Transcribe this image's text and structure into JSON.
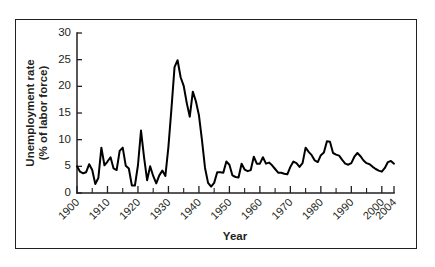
{
  "chart_data": {
    "type": "line",
    "title": "",
    "xlabel": "Year",
    "ylabel_line1": "Unemployment rate",
    "ylabel_line2": "(% of labor force)",
    "ylim": [
      0,
      30
    ],
    "xlim": [
      1900,
      2004
    ],
    "yticks": [
      0,
      5,
      10,
      15,
      20,
      25,
      30
    ],
    "ytick_labels": [
      "0",
      "5",
      "10",
      "15",
      "20",
      "25",
      "30"
    ],
    "xticks": [
      1900,
      1910,
      1920,
      1930,
      1940,
      1950,
      1960,
      1970,
      1980,
      1990,
      2000,
      2004
    ],
    "xtick_labels": [
      "1900",
      "1910",
      "1920",
      "1930",
      "1940",
      "1950",
      "1960",
      "1970",
      "1980",
      "1990",
      "2000",
      "2004"
    ],
    "xminor_tick_interval": 5,
    "grid": false,
    "legend": "none",
    "line_color": "#000000",
    "frame_color": "#231f20",
    "series": [
      {
        "name": "Unemployment rate (% of labor force)",
        "x": [
          1900,
          1901,
          1902,
          1903,
          1904,
          1905,
          1906,
          1907,
          1908,
          1909,
          1910,
          1911,
          1912,
          1913,
          1914,
          1915,
          1916,
          1917,
          1918,
          1919,
          1920,
          1921,
          1922,
          1923,
          1924,
          1925,
          1926,
          1927,
          1928,
          1929,
          1930,
          1931,
          1932,
          1933,
          1934,
          1935,
          1936,
          1937,
          1938,
          1939,
          1940,
          1941,
          1942,
          1943,
          1944,
          1945,
          1946,
          1947,
          1948,
          1949,
          1950,
          1951,
          1952,
          1953,
          1954,
          1955,
          1956,
          1957,
          1958,
          1959,
          1960,
          1961,
          1962,
          1963,
          1964,
          1965,
          1966,
          1967,
          1968,
          1969,
          1970,
          1971,
          1972,
          1973,
          1974,
          1975,
          1976,
          1977,
          1978,
          1979,
          1980,
          1981,
          1982,
          1983,
          1984,
          1985,
          1986,
          1987,
          1988,
          1989,
          1990,
          1991,
          1992,
          1993,
          1994,
          1995,
          1996,
          1997,
          1998,
          1999,
          2000,
          2001,
          2002,
          2003,
          2004
        ],
        "values": [
          5.0,
          4.0,
          3.7,
          3.9,
          5.4,
          4.3,
          1.7,
          2.8,
          8.5,
          5.2,
          5.9,
          6.7,
          4.6,
          4.3,
          7.9,
          8.5,
          5.1,
          4.6,
          1.4,
          1.4,
          5.2,
          11.7,
          6.7,
          2.4,
          5.0,
          3.2,
          1.8,
          3.3,
          4.2,
          3.2,
          8.7,
          15.9,
          23.6,
          24.9,
          21.7,
          20.1,
          16.9,
          14.3,
          19.0,
          17.2,
          14.6,
          9.9,
          4.7,
          1.9,
          1.2,
          1.9,
          3.9,
          3.9,
          3.8,
          5.9,
          5.3,
          3.3,
          3.0,
          2.9,
          5.5,
          4.4,
          4.1,
          4.3,
          6.8,
          5.5,
          5.5,
          6.7,
          5.5,
          5.7,
          5.2,
          4.5,
          3.8,
          3.8,
          3.6,
          3.5,
          4.9,
          5.9,
          5.6,
          4.9,
          5.6,
          8.5,
          7.7,
          7.1,
          6.1,
          5.8,
          7.1,
          7.6,
          9.7,
          9.6,
          7.5,
          7.2,
          7.0,
          6.2,
          5.5,
          5.3,
          5.6,
          6.8,
          7.5,
          6.9,
          6.1,
          5.6,
          5.4,
          4.9,
          4.5,
          4.2,
          4.0,
          4.7,
          5.8,
          6.0,
          5.5
        ]
      }
    ]
  }
}
